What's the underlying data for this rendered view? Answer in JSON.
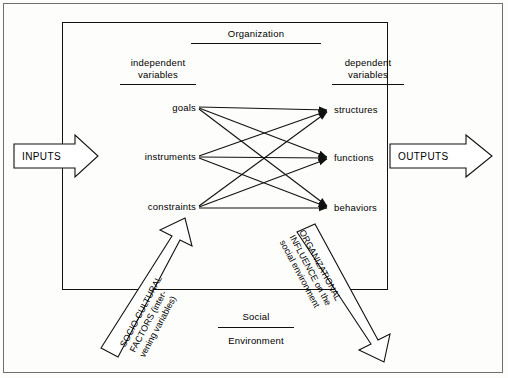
{
  "diagram": {
    "title_organization": "Organization",
    "columns": {
      "independent_heading_line1": "independent",
      "independent_heading_line2": "variables",
      "dependent_heading_line1": "dependent",
      "dependent_heading_line2": "variables"
    },
    "independent_items": [
      "goals",
      "instruments",
      "constraints"
    ],
    "dependent_items": [
      "structures",
      "functions",
      "behaviors"
    ],
    "inputs_label": "INPUTS",
    "outputs_label": "OUTPUTS",
    "left_arrow_text_line1": "SOCIO-CULTURAL",
    "left_arrow_text_line2": "FACTORS (inter-",
    "left_arrow_text_line3": "vening variables)",
    "right_arrow_text_line1": "ORGANIZATIONAL",
    "right_arrow_text_line2": "INFLUENCE on the",
    "right_arrow_text_line3": "social environment",
    "footer_line1": "Social",
    "footer_line2": "Environment"
  }
}
